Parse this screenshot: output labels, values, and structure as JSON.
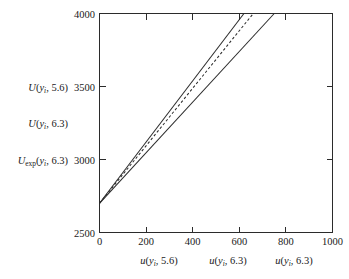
{
  "chart_data": {
    "type": "line",
    "title": "",
    "xlabel": "",
    "ylabel": "",
    "xlim": [
      0,
      1000
    ],
    "ylim": [
      2500,
      4000
    ],
    "grid": false,
    "legend_position": "axis-labels",
    "x_ticks": [
      0,
      200,
      400,
      600,
      800,
      1000
    ],
    "y_ticks": [
      2500,
      3000,
      3500,
      4000
    ],
    "x_tick_labels": [
      "0",
      "200",
      "400",
      "600",
      "800",
      "1000"
    ],
    "y_tick_labels": [
      "2500",
      "3000",
      "3500",
      "4000"
    ],
    "series": [
      {
        "name": "U(y_i, 5.6)",
        "style": "solid",
        "x": [
          0,
          620
        ],
        "values": [
          2700,
          4000
        ]
      },
      {
        "name": "U(y_i, 6.3)",
        "style": "dashed",
        "x": [
          0,
          660
        ],
        "values": [
          2700,
          4000
        ]
      },
      {
        "name": "U_exp(y_i, 6.3)",
        "style": "solid",
        "x": [
          0,
          750
        ],
        "values": [
          2700,
          4000
        ]
      }
    ]
  },
  "y_axis": {
    "ticks": [
      {
        "value": "4000"
      },
      {
        "value": "3500"
      },
      {
        "value": "3000"
      },
      {
        "value": "2500"
      }
    ],
    "curve_labels": [
      {
        "head": "U",
        "head_sub": "",
        "open": "(",
        "var": "y",
        "var_sub": "i",
        "rest": ", 5.6)"
      },
      {
        "head": "U",
        "head_sub": "",
        "open": "(",
        "var": "y",
        "var_sub": "i",
        "rest": ", 6.3)"
      },
      {
        "head": "U",
        "head_sub": "exp",
        "open": "(",
        "var": "y",
        "var_sub": "i",
        "rest": ", 6.3)"
      }
    ]
  },
  "x_axis": {
    "ticks": [
      {
        "value": "0"
      },
      {
        "value": "200"
      },
      {
        "value": "400"
      },
      {
        "value": "600"
      },
      {
        "value": "800"
      },
      {
        "value": "1000"
      }
    ],
    "curve_labels": [
      {
        "head": "u",
        "open": "(",
        "var": "y",
        "var_sub": "i",
        "rest": ", 5.6)"
      },
      {
        "head": "u",
        "open": "(",
        "var": "y",
        "var_sub": "i",
        "rest": ", 6.3)"
      },
      {
        "head": "u",
        "open": "(",
        "var": "y",
        "var_sub": "i",
        "rest": ", 6.3)"
      }
    ]
  },
  "colors": {
    "line": "#2b2b2b",
    "axis": "#2b2b2b",
    "text": "#1a1a1a",
    "background": "#ffffff"
  }
}
